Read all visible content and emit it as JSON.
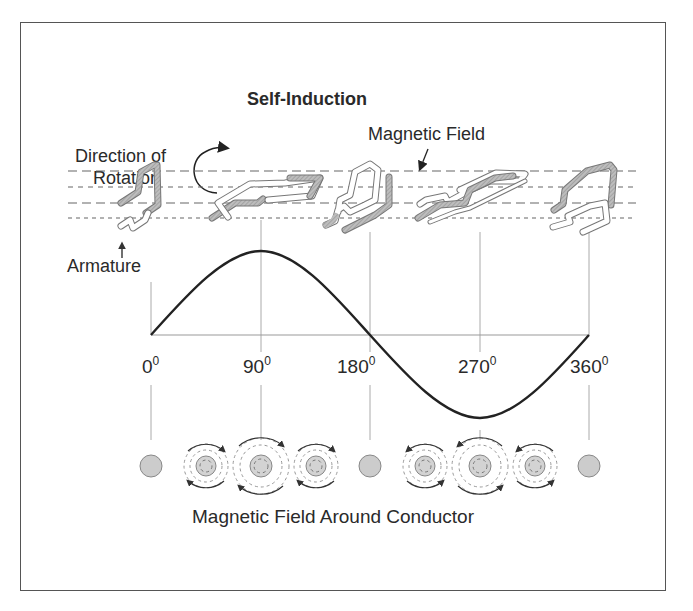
{
  "diagram": {
    "title": "Self-Induction",
    "labels": {
      "rotation_line1": "Direction of",
      "rotation_line2": "Rotation",
      "magnetic_field": "Magnetic Field",
      "armature": "Armature",
      "bottom_caption": "Magnetic Field Around Conductor"
    },
    "angle_ticks": [
      {
        "value": "0",
        "unit": "0"
      },
      {
        "value": "90",
        "unit": "0"
      },
      {
        "value": "180",
        "unit": "0"
      },
      {
        "value": "270",
        "unit": "0"
      },
      {
        "value": "360",
        "unit": "0"
      }
    ],
    "waveform": {
      "type": "sine",
      "cycles": 1,
      "start_deg": 0,
      "end_deg": 360
    },
    "conductors": [
      {
        "angle": "0",
        "field": "none"
      },
      {
        "angle": "45",
        "field": "clockwise-small"
      },
      {
        "angle": "90",
        "field": "clockwise-large"
      },
      {
        "angle": "135",
        "field": "clockwise-small"
      },
      {
        "angle": "180",
        "field": "none"
      },
      {
        "angle": "225",
        "field": "counterclockwise-small"
      },
      {
        "angle": "270",
        "field": "counterclockwise-large"
      },
      {
        "angle": "315",
        "field": "counterclockwise-small"
      },
      {
        "angle": "360",
        "field": "none"
      }
    ],
    "colors": {
      "line": "#222222",
      "grid": "#999999",
      "conductor_fill": "#d0d0d0",
      "frame": "#555555"
    }
  }
}
